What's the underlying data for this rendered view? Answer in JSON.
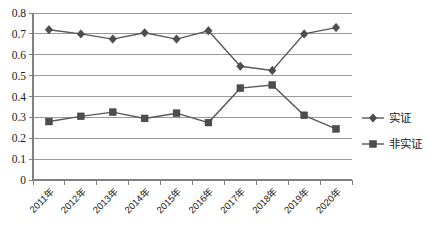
{
  "chart_data": {
    "type": "line",
    "title": "",
    "xlabel": "",
    "ylabel": "",
    "ylim": [
      0,
      0.8
    ],
    "ytick_step": 0.1,
    "grid": true,
    "legend_position": "right",
    "categories": [
      "2011年",
      "2012年",
      "2013年",
      "2014年",
      "2015年",
      "2016年",
      "2017年",
      "2018年",
      "2019年",
      "2020年"
    ],
    "ytick_labels": [
      "0.8",
      "0.7",
      "0.6",
      "0.5",
      "0.4",
      "0.3",
      "0.2",
      "0.1",
      "0"
    ],
    "ytick_values": [
      0.8,
      0.7,
      0.6,
      0.5,
      0.4,
      0.3,
      0.2,
      0.1,
      0
    ],
    "series": [
      {
        "name": "实证",
        "marker": "diamond",
        "color": "#4d4d4d",
        "values": [
          0.72,
          0.7,
          0.675,
          0.705,
          0.675,
          0.715,
          0.545,
          0.525,
          0.7,
          0.73
        ]
      },
      {
        "name": "非实证",
        "marker": "square",
        "color": "#4d4d4d",
        "values": [
          0.28,
          0.305,
          0.325,
          0.295,
          0.32,
          0.275,
          0.44,
          0.455,
          0.31,
          0.245
        ]
      }
    ]
  },
  "legend": {
    "items": [
      {
        "label": "实证",
        "marker": "diamond"
      },
      {
        "label": "非实证",
        "marker": "square"
      }
    ]
  },
  "colors": {
    "series": "#4d4d4d",
    "line": "#595959",
    "grid": "#9a9a9a",
    "axis": "#808080",
    "background": "#ffffff",
    "text": "#1a1a1a"
  }
}
